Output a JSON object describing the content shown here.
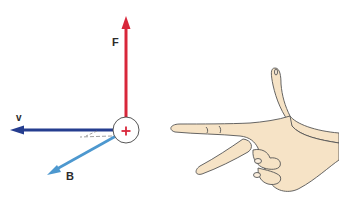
{
  "diagram": {
    "labels": {
      "force": "F",
      "velocity": "v",
      "field": "B",
      "charge": "+"
    },
    "colors": {
      "force": "#d8263a",
      "velocity": "#253d8f",
      "field": "#4d98cf",
      "charge": "#d8263a",
      "skin": "#f6e3c6",
      "outline": "#555555"
    },
    "hand": {
      "description": "right hand: thumb up, index finger pointing left, middle finger pointing down-left"
    }
  }
}
